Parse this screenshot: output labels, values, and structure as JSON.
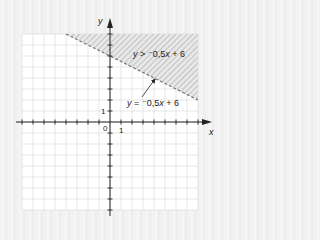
{
  "chart_data": {
    "type": "line",
    "title": "",
    "xlabel": "x",
    "ylabel": "y",
    "xlim": [
      -8,
      8
    ],
    "ylim": [
      -8,
      8
    ],
    "grid": true,
    "origin_label": "0",
    "x_unit_label": "1",
    "y_unit_label": "1",
    "series": [
      {
        "name": "boundary",
        "equation": "y = -0.5x + 6",
        "slope": -0.5,
        "intercept": 6,
        "style": "dashed",
        "x": [
          -4,
          8
        ],
        "y": [
          8,
          2
        ]
      }
    ],
    "shaded_region": {
      "inequality": "y > -0.5x + 6",
      "side": "above",
      "fill": "hatched"
    },
    "annotations": [
      {
        "text_parts": [
          "y",
          " > ",
          "⁻0,5",
          "x",
          " + 6"
        ],
        "role": "inequality-label"
      },
      {
        "text_parts": [
          "y",
          " = ",
          "⁻0,5",
          "x",
          " + 6"
        ],
        "role": "boundary-label",
        "arrow_to": [
          4,
          4
        ]
      }
    ]
  },
  "colors": {
    "grid": "#d6d6d6",
    "axis": "#222222",
    "hatch": "#9a9a9a",
    "plot_bg": "#ffffff",
    "shade_bg": "#e6e6e6"
  }
}
